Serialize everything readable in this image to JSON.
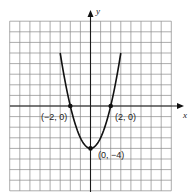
{
  "chart_data": {
    "type": "line",
    "title": "",
    "function": "y = x^2 - 4",
    "xlabel": "x",
    "ylabel": "y",
    "xlim": [
      -8,
      8
    ],
    "ylim": [
      -8,
      8
    ],
    "grid": true,
    "grid_step": 1,
    "curve_x_range": [
      -3,
      3
    ],
    "x": [
      -3,
      -2.5,
      -2,
      -1.5,
      -1,
      -0.5,
      0,
      0.5,
      1,
      1.5,
      2,
      2.5,
      3
    ],
    "y": [
      5,
      2.25,
      0,
      -1.75,
      -3,
      -3.75,
      -4,
      -3.75,
      -3,
      -1.75,
      0,
      2.25,
      5
    ],
    "points": [
      {
        "x": -2,
        "y": 0,
        "label": "(−2, 0)"
      },
      {
        "x": 2,
        "y": 0,
        "label": "(2, 0)"
      },
      {
        "x": 0,
        "y": -4,
        "label": "(0, −4)"
      }
    ]
  },
  "labels": {
    "x_axis": "x",
    "y_axis": "y",
    "point_neg2_0": "(−2, 0)",
    "point_2_0": "(2, 0)",
    "point_0_neg4": "(0, −4)"
  }
}
